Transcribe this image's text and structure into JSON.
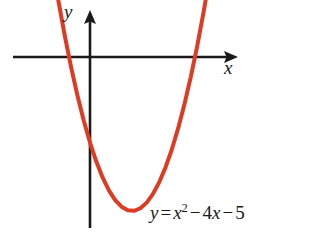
{
  "figure": {
    "background_color": "#ffffff"
  },
  "axes": {
    "x_label": "x",
    "y_label": "y",
    "axis_color": "#1a1a1a",
    "x_axis": {
      "y_px": 57,
      "x_start_px": 13,
      "x_end_px": 238,
      "arrow": "right"
    },
    "y_axis": {
      "x_px": 90,
      "y_start_px": 10,
      "y_end_px": 228,
      "arrow": "up"
    }
  },
  "equation": {
    "lhs": "y",
    "equals": "=",
    "var1": "x",
    "exponent": "2",
    "minus1": "−",
    "coefficient": "4",
    "var2": "x",
    "minus2": "−",
    "constant": "5",
    "full_text": "y = x² − 4x − 5"
  },
  "chart_data": {
    "type": "line",
    "title": "",
    "subtitle": "",
    "xlabel": "x",
    "ylabel": "y",
    "function": "y = x^2 - 4x - 5",
    "curve_color": "#de3b24",
    "curve_width_px": 4,
    "grid": false,
    "legend": "none",
    "annotations": [
      "y = x² − 4x − 5"
    ],
    "xlim": [
      -3.1,
      6.6
    ],
    "ylim": [
      -11.5,
      14.0
    ],
    "roots": [
      -1,
      5
    ],
    "vertex": [
      2,
      -9
    ],
    "y_intercept": -5,
    "x": [
      -2.1,
      -1.8,
      -1.5,
      -1.2,
      -0.9,
      -0.6,
      -0.3,
      0,
      0.3,
      0.6,
      0.9,
      1.2,
      1.5,
      1.8,
      2.1,
      2.4,
      2.7,
      3,
      3.3,
      3.6,
      3.9,
      4.2,
      4.5,
      4.8,
      5.1,
      5.4,
      5.7,
      6.0,
      6.1
    ],
    "y": [
      7.81,
      5.44,
      3.25,
      1.24,
      -0.59,
      -2.24,
      -3.71,
      -5,
      -6.11,
      -7.04,
      -7.79,
      -8.36,
      -8.75,
      -8.96,
      -8.99,
      -8.84,
      -8.51,
      -8,
      -7.31,
      -6.44,
      -5.39,
      -4.16,
      -2.75,
      -1.16,
      0.61,
      2.56,
      4.69,
      7.0,
      7.81
    ],
    "points_px": [
      [
        62,
        22
      ],
      [
        70,
        57
      ],
      [
        90,
        148
      ],
      [
        133,
        211
      ],
      [
        195,
        57
      ],
      [
        202,
        22
      ]
    ]
  }
}
